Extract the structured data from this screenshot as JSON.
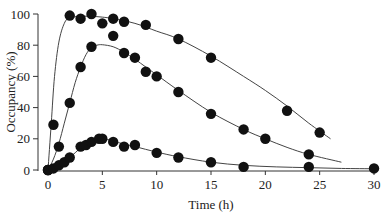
{
  "chart_data": {
    "type": "scatter",
    "title": "",
    "xlabel": "Time (h)",
    "ylabel": "Occupancy (%)",
    "xlim": [
      0,
      30
    ],
    "ylim": [
      0,
      100
    ],
    "xticks": [
      0,
      5,
      10,
      15,
      20,
      25,
      30
    ],
    "yticks": [
      0,
      20,
      40,
      60,
      80,
      100
    ],
    "grid": false,
    "legend": null,
    "series": [
      {
        "name": "high",
        "points": [
          [
            0,
            0
          ],
          [
            0.5,
            29
          ],
          [
            2,
            99
          ],
          [
            3,
            97
          ],
          [
            4,
            100
          ],
          [
            5,
            94
          ],
          [
            6,
            97
          ],
          [
            7,
            95
          ],
          [
            9,
            93
          ],
          [
            12,
            84
          ],
          [
            15,
            72
          ],
          [
            22,
            38
          ],
          [
            25,
            24
          ]
        ],
        "fit": [
          [
            0,
            0
          ],
          [
            0.3,
            30
          ],
          [
            0.6,
            60
          ],
          [
            1,
            82
          ],
          [
            1.5,
            94
          ],
          [
            2,
            97.5
          ],
          [
            3,
            98.5
          ],
          [
            4,
            98.5
          ],
          [
            5,
            98
          ],
          [
            6,
            97
          ],
          [
            8,
            94
          ],
          [
            10,
            89
          ],
          [
            12,
            84
          ],
          [
            15,
            73
          ],
          [
            18,
            60
          ],
          [
            20,
            51
          ],
          [
            22,
            41
          ],
          [
            24,
            30
          ],
          [
            26,
            20
          ]
        ]
      },
      {
        "name": "medium",
        "points": [
          [
            0,
            0
          ],
          [
            1,
            15
          ],
          [
            2,
            43
          ],
          [
            3,
            66
          ],
          [
            4,
            79
          ],
          [
            6,
            86
          ],
          [
            7,
            75
          ],
          [
            8,
            72
          ],
          [
            9,
            63
          ],
          [
            10,
            60
          ],
          [
            12,
            50
          ],
          [
            15,
            36
          ],
          [
            18,
            26
          ],
          [
            20,
            20
          ],
          [
            24,
            10
          ]
        ],
        "fit": [
          [
            0,
            0
          ],
          [
            0.5,
            7
          ],
          [
            1,
            17
          ],
          [
            1.5,
            30
          ],
          [
            2,
            43
          ],
          [
            2.5,
            56
          ],
          [
            3,
            66
          ],
          [
            3.5,
            74
          ],
          [
            4,
            78.5
          ],
          [
            4.5,
            80
          ],
          [
            5,
            80.3
          ],
          [
            6,
            79
          ],
          [
            7,
            75.5
          ],
          [
            8,
            71
          ],
          [
            9,
            66
          ],
          [
            10,
            61
          ],
          [
            12,
            51
          ],
          [
            15,
            37
          ],
          [
            18,
            26
          ],
          [
            20,
            20
          ],
          [
            22,
            14.5
          ],
          [
            24,
            10
          ],
          [
            27,
            5
          ]
        ]
      },
      {
        "name": "low",
        "points": [
          [
            0,
            0
          ],
          [
            0.5,
            1
          ],
          [
            1,
            3
          ],
          [
            1.5,
            5
          ],
          [
            2,
            8
          ],
          [
            3,
            15
          ],
          [
            3.5,
            16
          ],
          [
            4,
            18
          ],
          [
            4.7,
            20
          ],
          [
            5,
            20
          ],
          [
            6,
            18
          ],
          [
            7,
            15
          ],
          [
            8,
            16
          ],
          [
            10,
            11
          ],
          [
            12,
            8
          ],
          [
            15,
            5
          ],
          [
            18,
            2
          ],
          [
            24,
            2
          ],
          [
            30,
            1
          ]
        ],
        "fit": [
          [
            0,
            0
          ],
          [
            1,
            3
          ],
          [
            2,
            8
          ],
          [
            3,
            14
          ],
          [
            4,
            18
          ],
          [
            4.8,
            19.5
          ],
          [
            5.5,
            19.5
          ],
          [
            6.5,
            17.5
          ],
          [
            8,
            15
          ],
          [
            10,
            11.5
          ],
          [
            12,
            8.5
          ],
          [
            15,
            5
          ],
          [
            18,
            3
          ],
          [
            21,
            2
          ],
          [
            24,
            1.5
          ],
          [
            27,
            1
          ],
          [
            30,
            0.8
          ]
        ]
      }
    ]
  }
}
